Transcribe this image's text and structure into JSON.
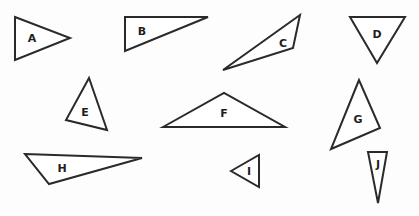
{
  "diagram": {
    "title": "",
    "shapes": [
      {
        "label": "A",
        "type": "triangle"
      },
      {
        "label": "B",
        "type": "triangle"
      },
      {
        "label": "C",
        "type": "triangle"
      },
      {
        "label": "D",
        "type": "triangle"
      },
      {
        "label": "E",
        "type": "triangle"
      },
      {
        "label": "F",
        "type": "triangle"
      },
      {
        "label": "G",
        "type": "triangle"
      },
      {
        "label": "H",
        "type": "triangle"
      },
      {
        "label": "I",
        "type": "triangle"
      },
      {
        "label": "J",
        "type": "triangle"
      }
    ],
    "colors": {
      "stroke": "#2a2a2a",
      "fill": "#ffffff",
      "label": "#1e1e1e"
    }
  }
}
